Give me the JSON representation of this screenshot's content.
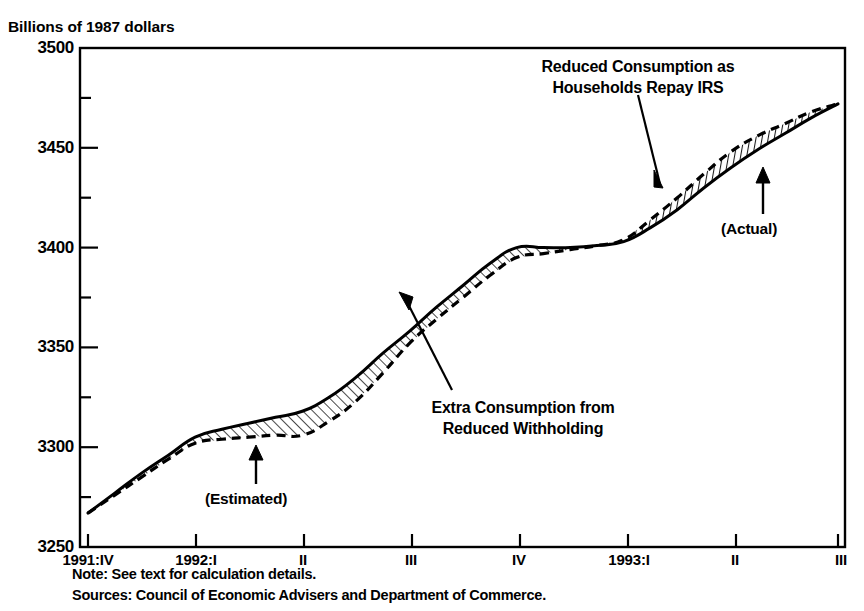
{
  "chart_data": {
    "type": "line",
    "title": "",
    "ylabel": "Billions of 1987 dollars",
    "xlabel": "",
    "ylim": [
      3250,
      3500
    ],
    "y_ticks": [
      "3250",
      "3300",
      "3350",
      "3400",
      "3450",
      "3500"
    ],
    "y_tick_values": [
      3250,
      3300,
      3350,
      3400,
      3450,
      3500
    ],
    "y_minor_tick_values": [
      3275,
      3325,
      3375,
      3425,
      3475
    ],
    "grid": false,
    "legend_position": "none",
    "categories": [
      "1991:IV",
      "1992:I",
      "II",
      "III",
      "IV",
      "1993:I",
      "II",
      "III"
    ],
    "x": [
      0,
      1,
      2,
      3,
      4,
      5,
      6,
      7
    ],
    "series": [
      {
        "name": "(Actual)",
        "style": "solid",
        "values": [
          3267,
          3305,
          3318,
          3358,
          3400,
          3403,
          3440,
          3472
        ],
        "dense_x": [
          0,
          0.25,
          0.5,
          0.75,
          1,
          1.25,
          1.5,
          1.75,
          2,
          2.25,
          2.5,
          2.75,
          3,
          3.25,
          3.5,
          3.75,
          4,
          4.25,
          4.5,
          4.75,
          5,
          5.25,
          5.5,
          5.75,
          6,
          6.25,
          6.5,
          6.75,
          7
        ],
        "dense_y": [
          3267,
          3277,
          3287,
          3296,
          3305,
          3309,
          3312,
          3315,
          3318,
          3325,
          3335,
          3347,
          3358,
          3370,
          3381,
          3392,
          3400,
          3400,
          3400,
          3401,
          3403,
          3410,
          3419,
          3430,
          3440,
          3449,
          3457,
          3465,
          3472
        ]
      },
      {
        "name": "(Estimated)",
        "style": "dashed",
        "values": [
          3267,
          3302,
          3306,
          3352,
          3395,
          3404,
          3448,
          3472
        ],
        "dense_x": [
          0,
          0.25,
          0.5,
          0.75,
          1,
          1.25,
          1.5,
          1.75,
          2,
          2.25,
          2.5,
          2.75,
          3,
          3.25,
          3.5,
          3.75,
          4,
          4.25,
          4.5,
          4.75,
          5,
          5.25,
          5.5,
          5.75,
          6,
          6.25,
          6.5,
          6.75,
          7
        ],
        "dense_y": [
          3267,
          3276,
          3285,
          3294,
          3302,
          3304,
          3305,
          3306,
          3306,
          3313,
          3323,
          3337,
          3352,
          3364,
          3375,
          3386,
          3395,
          3397,
          3399,
          3401,
          3404,
          3414,
          3425,
          3437,
          3448,
          3456,
          3462,
          3468,
          3472
        ]
      }
    ],
    "annotations": [
      {
        "id": "reduced-consumption",
        "text": "Reduced Consumption as\nHouseholds Repay IRS",
        "line1": "Reduced Consumption as",
        "line2": "Households Repay IRS"
      },
      {
        "id": "extra-consumption",
        "text": "Extra Consumption from\nReduced Withholding",
        "line1": "Extra Consumption from",
        "line2": "Reduced Withholding"
      },
      {
        "id": "estimated",
        "text": "(Estimated)"
      },
      {
        "id": "actual",
        "text": "(Actual)"
      }
    ]
  },
  "axis": {
    "y_title": "Billions of 1987 dollars",
    "y_labels": [
      "3500",
      "3450",
      "3400",
      "3350",
      "3300",
      "3250"
    ],
    "x_labels": [
      "1991:IV",
      "1992:I",
      "II",
      "III",
      "IV",
      "1993:I",
      "II",
      "III"
    ]
  },
  "annotations": {
    "reduced_consumption_line1": "Reduced Consumption as",
    "reduced_consumption_line2": "Households Repay IRS",
    "extra_consumption_line1": "Extra Consumption from",
    "extra_consumption_line2": "Reduced Withholding",
    "estimated": "(Estimated)",
    "actual": "(Actual)"
  },
  "footnotes": {
    "note": "Note: See text for calculation details.",
    "sources": "Sources: Council of Economic Advisers and Department of Commerce."
  },
  "colors": {
    "ink": "#000000",
    "paper": "#ffffff",
    "hatch": "#2b2b2b"
  }
}
